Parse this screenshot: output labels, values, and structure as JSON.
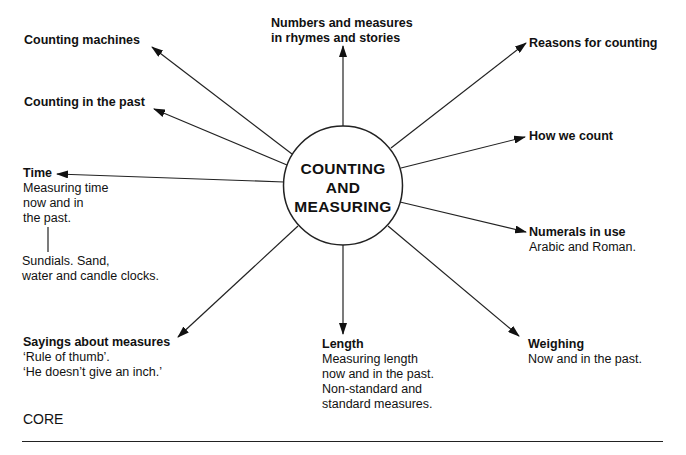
{
  "center": {
    "lines": [
      "COUNTING",
      "AND",
      "MEASURING"
    ]
  },
  "nodes": {
    "counting_machines": {
      "title": "Counting machines"
    },
    "counting_past": {
      "title": "Counting in the past"
    },
    "numbers_rhymes": {
      "title_lines": [
        "Numbers and measures",
        "in rhymes and stories"
      ]
    },
    "reasons": {
      "title": "Reasons for counting"
    },
    "how_count": {
      "title": "How we count"
    },
    "time": {
      "title": "Time",
      "lines": [
        "Measuring time",
        "now and in",
        "the past."
      ],
      "sub_lines": [
        "Sundials. Sand,",
        "water and candle clocks."
      ]
    },
    "numerals": {
      "title": "Numerals in use",
      "lines": [
        "Arabic and Roman."
      ]
    },
    "sayings": {
      "title": "Sayings about measures",
      "lines": [
        "‘Rule of thumb’.",
        "‘He doesn’t give an inch.’"
      ]
    },
    "length": {
      "title": "Length",
      "lines": [
        "Measuring length",
        "now and in the past.",
        "Non-standard and",
        "standard measures."
      ]
    },
    "weighing": {
      "title": "Weighing",
      "lines": [
        "Now and in the past."
      ]
    }
  },
  "footer": {
    "label": "CORE"
  },
  "colors": {
    "ink": "#111111",
    "background": "#ffffff"
  }
}
